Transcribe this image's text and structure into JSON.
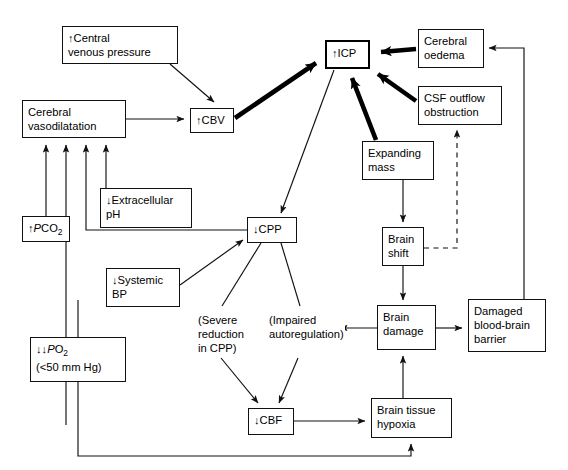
{
  "diagram": {
    "canvas": {
      "width": 568,
      "height": 470
    },
    "colors": {
      "stroke": "#111111",
      "emphasis_stroke": "#000000",
      "background": "#ffffff"
    },
    "nodes": [
      {
        "id": "central-venous-pressure",
        "label": "↑Central\nvenous pressure",
        "x": 62,
        "y": 26,
        "w": 116,
        "h": 38,
        "emphasis": false
      },
      {
        "id": "cerebral-vasodilatation",
        "label": "Cerebral\nvasodilatation",
        "x": 22,
        "y": 100,
        "w": 104,
        "h": 38,
        "emphasis": false
      },
      {
        "id": "cbv",
        "label": "↑CBV",
        "x": 190,
        "y": 108,
        "w": 44,
        "h": 25,
        "emphasis": false
      },
      {
        "id": "icp",
        "label": "↑ICP",
        "x": 325,
        "y": 40,
        "w": 45,
        "h": 29,
        "emphasis": true
      },
      {
        "id": "cerebral-oedema",
        "label": "Cerebral\noedema",
        "x": 418,
        "y": 29,
        "w": 66,
        "h": 39,
        "emphasis": false
      },
      {
        "id": "csf-outflow-obstruction",
        "label": "CSF outflow\nobstruction",
        "x": 418,
        "y": 86,
        "w": 84,
        "h": 39,
        "emphasis": false
      },
      {
        "id": "expanding-mass",
        "label": "Expanding\nmass",
        "x": 362,
        "y": 141,
        "w": 72,
        "h": 39,
        "emphasis": false
      },
      {
        "id": "extracellular-ph",
        "label": "↓Extracellular\npH",
        "x": 100,
        "y": 188,
        "w": 92,
        "h": 40,
        "emphasis": false
      },
      {
        "id": "pco2",
        "label": "↑<i>P</i>CO<span class=\"sub\">2</span>",
        "x": 22,
        "y": 216,
        "w": 48,
        "h": 26,
        "emphasis": false
      },
      {
        "id": "cpp",
        "label": "↓CPP",
        "x": 247,
        "y": 217,
        "w": 50,
        "h": 26,
        "emphasis": false
      },
      {
        "id": "systemic-bp",
        "label": "↓Systemic\nBP",
        "x": 106,
        "y": 268,
        "w": 74,
        "h": 39,
        "emphasis": false
      },
      {
        "id": "brain-shift",
        "label": "Brain\nshift",
        "x": 382,
        "y": 227,
        "w": 42,
        "h": 39,
        "emphasis": false
      },
      {
        "id": "po2",
        "label": "↓↓<i>P</i>O<span class=\"sub\">2</span>\n(<50 mm Hg)",
        "x": 30,
        "y": 337,
        "w": 96,
        "h": 45,
        "emphasis": false
      },
      {
        "id": "brain-damage",
        "label": "Brain\ndamage",
        "x": 377,
        "y": 305,
        "w": 59,
        "h": 45,
        "emphasis": false
      },
      {
        "id": "damaged-blood-brain-barrier",
        "label": "Damaged\nblood-brain\nbarrier",
        "x": 468,
        "y": 299,
        "w": 78,
        "h": 53,
        "emphasis": false
      },
      {
        "id": "cbf",
        "label": "↓CBF",
        "x": 248,
        "y": 408,
        "w": 46,
        "h": 27,
        "emphasis": false
      },
      {
        "id": "brain-tissue-hypoxia",
        "label": "Brain tissue\nhypoxia",
        "x": 371,
        "y": 398,
        "w": 81,
        "h": 40,
        "emphasis": false
      }
    ],
    "free_labels": [
      {
        "id": "severe-reduction-in-cpp",
        "label": "(Severe\nreduction\nin CPP)",
        "x": 197,
        "y": 313
      },
      {
        "id": "impaired-autoregulation",
        "label": "(Impaired\nautoregulation)",
        "x": 268,
        "y": 313
      }
    ],
    "edge_notes": {
      "thick_edges": [
        "cbv→icp",
        "cerebral-oedema→icp",
        "csf-outflow-obstruction→icp",
        "expanding-mass→icp"
      ],
      "dashed_edges": [
        "brain-shift→csf-outflow-obstruction"
      ],
      "feedback_edges": [
        "damaged-blood-brain-barrier→cerebral-oedema",
        "cbf→cerebral-vasodilatation (via left rail)",
        "brain-tissue-hypoxia→cerebral-vasodilatation (via bottom rail)"
      ]
    }
  }
}
